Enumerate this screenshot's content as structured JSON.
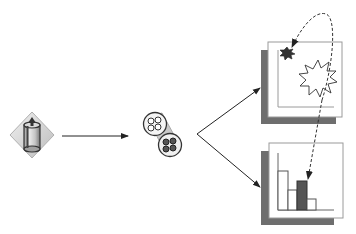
{
  "diagram": {
    "nodes": [
      {
        "id": "source",
        "icon": "database-cylinder-icon",
        "label": ""
      },
      {
        "id": "processor",
        "icon": "twin-reel-icon",
        "label": ""
      },
      {
        "id": "panel-top",
        "icon": "starburst-panel-icon",
        "label": ""
      },
      {
        "id": "panel-bottom",
        "icon": "bar-chart-panel-icon",
        "label": ""
      }
    ],
    "edges": [
      {
        "from": "source",
        "to": "processor",
        "style": "solid"
      },
      {
        "from": "processor",
        "to": "panel-top",
        "style": "solid"
      },
      {
        "from": "processor",
        "to": "panel-bottom",
        "style": "solid"
      },
      {
        "from": "panel-bottom",
        "to": "panel-top",
        "style": "dashed",
        "note": "linked highlight"
      },
      {
        "from": "panel-top",
        "to": "panel-bottom",
        "style": "dashed",
        "note": "linked highlight"
      }
    ],
    "bar_chart": {
      "bars": [
        {
          "height": 39,
          "highlighted": false
        },
        {
          "height": 20,
          "highlighted": false
        },
        {
          "height": 29,
          "highlighted": true
        },
        {
          "height": 11,
          "highlighted": false
        }
      ]
    },
    "colors": {
      "line": "#222222",
      "shadow": "#6e6e6e",
      "frame": "#9a9a9a",
      "highlight": "#555555",
      "diamond": "#d4d4d4"
    }
  }
}
